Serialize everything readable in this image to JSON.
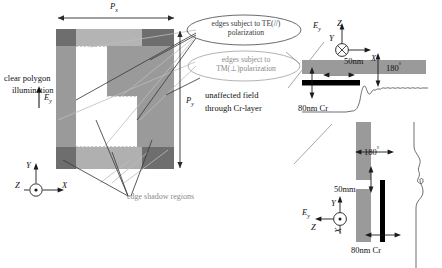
{
  "figure": {
    "title_axes": {
      "main_triad": {
        "y": "Y",
        "x": "X",
        "z": "Z"
      },
      "inset_top_triad": {
        "z": "Z",
        "y": "Y",
        "x": "X"
      },
      "inset_bottom_triad": {
        "y": "Y",
        "z": "Z",
        "x": "X"
      }
    },
    "main_panel": {
      "period_x_label": "P",
      "period_x_sub": "x",
      "period_y_label": "P",
      "period_y_sub": "y",
      "illumination_line1": "clear polygon",
      "illumination_line2": "illumination",
      "field_label": "E",
      "field_sub": "y",
      "shadow_label": "edge shadow regions",
      "colors": {
        "mid_gray": "#9a9a9a",
        "dark_gray": "#6e6e6e",
        "light_gray": "#b4b4b4",
        "clear_white": "#ffffff",
        "leader_gray": "#b9b9b9",
        "leader_dark": "#3d3d3d"
      }
    },
    "callouts": [
      {
        "id": "te-callout",
        "line1": "edges subject to TE(//)",
        "line2": "polarization"
      },
      {
        "id": "tm-callout",
        "line1": "edges subject to",
        "line2": "TM(⊥)polarization"
      }
    ],
    "unaffected": {
      "line1": "unaffected field",
      "line2": "through Cr-layer"
    },
    "inset_top": {
      "field_label": "E",
      "field_sub": "y",
      "thickness_label": "50nm",
      "phase_label": "180",
      "phase_unit": "°",
      "cr_label": "80nm Cr",
      "colors": {
        "bar": "#9a9a9a",
        "cr": "#000000",
        "curve": "#555555"
      }
    },
    "inset_bottom": {
      "field_label": "E",
      "field_sub": "y",
      "thickness_label": "50mm",
      "phase_label": "180",
      "phase_unit": "°",
      "cr_label": "80nm Cr",
      "colors": {
        "bar": "#9a9a9a",
        "cr": "#000000",
        "curve": "#555555"
      }
    }
  }
}
